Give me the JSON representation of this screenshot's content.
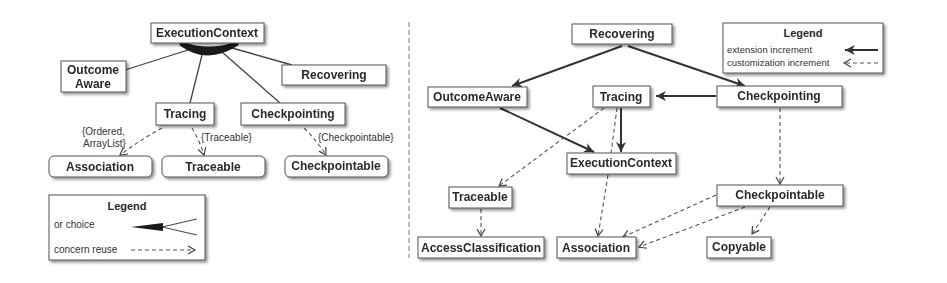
{
  "left_diagram": {
    "nodes": {
      "execution_context": "ExecutionContext",
      "outcome_aware_line1": "Outcome",
      "outcome_aware_line2": "Aware",
      "recovering": "Recovering",
      "tracing": "Tracing",
      "checkpointing": "Checkpointing",
      "association": "Association",
      "traceable": "Traceable",
      "checkpointable": "Checkpointable"
    },
    "edge_labels": {
      "ordered_line1": "{Ordered,",
      "ordered_line2": "ArrayList}",
      "traceable": "{Traceable}",
      "checkpointable": "{Checkpointable}"
    },
    "legend": {
      "title": "Legend",
      "or_choice": "or choice",
      "concern_reuse": "concern reuse"
    }
  },
  "right_diagram": {
    "nodes": {
      "recovering": "Recovering",
      "outcome_aware": "OutcomeAware",
      "tracing": "Tracing",
      "checkpointing": "Checkpointing",
      "execution_context": "ExecutionContext",
      "traceable": "Traceable",
      "checkpointable": "Checkpointable",
      "access_classification": "AccessClassification",
      "association": "Association",
      "copyable": "Copyable"
    },
    "legend": {
      "title": "Legend",
      "extension_increment": "extension increment",
      "customization_increment": "customization increment"
    }
  },
  "colors": {
    "stroke": "#444444",
    "node_fill": "#ffffff",
    "text": "#2a2a2a",
    "shadow": "#bdbdbd"
  }
}
